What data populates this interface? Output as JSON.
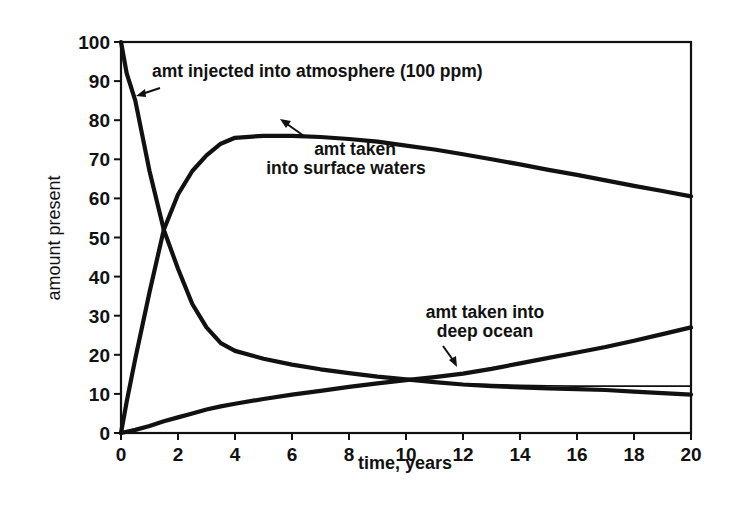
{
  "chart_data": {
    "type": "line",
    "title": "",
    "xlabel": "time, years",
    "ylabel": "amount present",
    "xlim": [
      0,
      20
    ],
    "ylim": [
      0,
      100
    ],
    "grid": false,
    "legend": "none (curves labeled by inline annotations with arrows)",
    "x_ticks": [
      0,
      2,
      4,
      6,
      8,
      10,
      12,
      14,
      16,
      18,
      20
    ],
    "y_ticks": [
      0,
      10,
      20,
      30,
      40,
      50,
      60,
      70,
      80,
      90,
      100
    ],
    "x": [
      0,
      0.2,
      0.5,
      1,
      1.5,
      2,
      2.5,
      3,
      3.5,
      4,
      5,
      6,
      7,
      8,
      9,
      10,
      11,
      12,
      13,
      14,
      15,
      16,
      17,
      18,
      19,
      20
    ],
    "series": [
      {
        "name": "amt injected into atmosphere (100 ppm)",
        "values": [
          100,
          92,
          85,
          67,
          52,
          42,
          33,
          27,
          23,
          21,
          19,
          17.5,
          16.3,
          15.3,
          14.4,
          13.7,
          13,
          12.4,
          12,
          11.7,
          11.4,
          11.2,
          11,
          10.6,
          10.2,
          9.8
        ]
      },
      {
        "name": "amt injected into atmosphere (thin variant)",
        "values": [
          null,
          null,
          null,
          null,
          null,
          null,
          null,
          null,
          null,
          null,
          null,
          null,
          null,
          null,
          null,
          null,
          13,
          12.6,
          12.4,
          12.2,
          12.1,
          12,
          12,
          12,
          12,
          12
        ]
      },
      {
        "name": "amt taken into surface waters",
        "values": [
          0,
          8,
          19,
          36,
          52,
          61,
          67,
          71,
          74,
          75.5,
          76,
          76,
          75.7,
          75.2,
          74.5,
          73.5,
          72.5,
          71.3,
          70,
          68.7,
          67.3,
          66,
          64.6,
          63.2,
          61.9,
          60.5
        ]
      },
      {
        "name": "amt taken into deep ocean",
        "values": [
          0,
          0.3,
          0.8,
          1.8,
          3,
          4,
          5,
          6,
          6.8,
          7.5,
          8.7,
          9.8,
          10.8,
          11.8,
          12.7,
          13.5,
          14.3,
          15.2,
          16.4,
          17.8,
          19.2,
          20.6,
          22,
          23.6,
          25.3,
          27
        ]
      }
    ],
    "annotations": [
      {
        "text": "amt injected into atmosphere (100 ppm)",
        "points_to": [
          0.3,
          88
        ]
      },
      {
        "text": "amt taken\ninto surface waters",
        "points_to": [
          5.7,
          74
        ]
      },
      {
        "text": "amt taken into\ndeep ocean",
        "points_to": [
          11.6,
          15
        ]
      }
    ]
  },
  "labels": {
    "xlabel": "time, years",
    "ylabel": "amount present",
    "x_ticks": [
      "0",
      "2",
      "4",
      "6",
      "8",
      "10",
      "12",
      "14",
      "16",
      "18",
      "20"
    ],
    "y_ticks": [
      "0",
      "10",
      "20",
      "30",
      "40",
      "50",
      "60",
      "70",
      "80",
      "90",
      "100"
    ],
    "annot_atmos": "amt injected into atmosphere (100 ppm)",
    "annot_surface_1": "amt taken",
    "annot_surface_2": "into surface waters",
    "annot_deep_1": "amt taken into",
    "annot_deep_2": "deep ocean"
  }
}
